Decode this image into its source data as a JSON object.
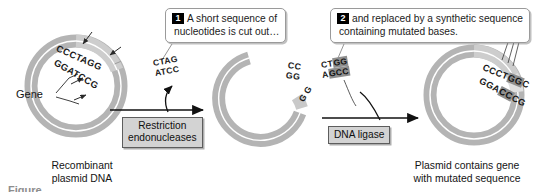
{
  "figure": {
    "background": "#ffffff"
  },
  "colors": {
    "plasmid_outer": "#b4b4b4",
    "plasmid_gene": "#cfcfcf",
    "plasmid_inner_line": "#ffffff",
    "callout_border": "#9a9a9a",
    "enzyme_box_fill": "#d3d3d3",
    "enzyme_box_border": "#5d5d5d",
    "step_badge": "#000000",
    "mutation_highlight": "#8f8f8f",
    "arrow": "#111111",
    "text": "#141414"
  },
  "callouts": [
    {
      "number": "1",
      "line1": "A short sequence of",
      "line2": "nucleotides is cut out…"
    },
    {
      "number": "2",
      "line1": "and replaced by a synthetic sequence",
      "line2": "containing mutated bases."
    }
  ],
  "enzymes": {
    "restriction_line1": "Restriction",
    "restriction_line2": "endonucleases",
    "ligase": "DNA ligase"
  },
  "captions": {
    "left_line1": "Recombinant",
    "left_line2": "plasmid DNA",
    "right_line1": "Plasmid contains gene",
    "right_line2": "with mutated sequence",
    "gene": "Gene",
    "cutoff_caption": "Figure"
  },
  "plasmids": [
    {
      "id": "recombinant-plasmid",
      "label": "Recombinant plasmid DNA",
      "sequence_top": "CCCTAGG",
      "sequence_bottom": "GGATCCG",
      "mutated_top": "",
      "mutated_bottom": ""
    },
    {
      "id": "cut-plasmid",
      "label": "Cut plasmid with sticky ends",
      "sequence_top_left": "CC",
      "sequence_bottom_left": "GG",
      "sequence_top_right": "G",
      "sequence_bottom_right": "G"
    },
    {
      "id": "mutated-plasmid",
      "label": "Plasmid contains gene with mutated sequence",
      "top_prefix": "CCCT",
      "top_mutated": "GG",
      "top_suffix": "C",
      "bottom_prefix": "GGA",
      "bottom_mutated": "CC",
      "bottom_suffix": "CG"
    }
  ],
  "fragments": [
    {
      "id": "excised-fragment",
      "top": "CTAG",
      "bottom": "ATCC",
      "mutated": false
    },
    {
      "id": "synthetic-fragment",
      "top_prefix": "CT",
      "top_mutated": "GG",
      "bottom_prefix": "A",
      "bottom_mutated": "GCC",
      "mutated": true
    }
  ]
}
